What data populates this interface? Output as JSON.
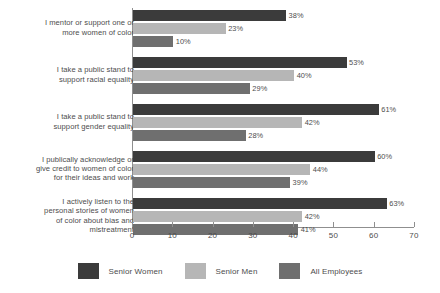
{
  "chart_data": {
    "type": "bar",
    "orientation": "horizontal",
    "title": "",
    "xlabel": "",
    "ylabel": "",
    "xlim": [
      0,
      70
    ],
    "xticks": [
      0,
      10,
      20,
      30,
      40,
      50,
      60,
      70
    ],
    "grid": false,
    "legend_position": "bottom",
    "value_suffix": "%",
    "categories": [
      "I mentor or support one or more women of color",
      "I take a public stand to support racial equality",
      "I take a public stand to support gender equality",
      "I publically acknowledge or give credit to women of color for their ideas and work",
      "I actively listen to the personal stories of women of color about bias and mistreatment"
    ],
    "category_lines": [
      [
        "I mentor or support one or",
        "more women of color"
      ],
      [
        "I take a public stand to",
        "support racial equality"
      ],
      [
        "I take a public stand to",
        "support gender equality"
      ],
      [
        "I publically acknowledge or",
        "give credit to women of color",
        "for their ideas and work"
      ],
      [
        "I actively listen to the",
        "personal stories of women",
        "of color about bias and",
        "mistreatment"
      ]
    ],
    "series": [
      {
        "name": "Senior Women",
        "color": "#3b3b3b",
        "values": [
          38,
          53,
          61,
          60,
          63
        ],
        "labels": [
          "38%",
          "53%",
          "61%",
          "60%",
          "63%"
        ]
      },
      {
        "name": "Senior Men",
        "color": "#b6b6b6",
        "values": [
          23,
          40,
          42,
          44,
          42
        ],
        "labels": [
          "23%",
          "40%",
          "42%",
          "44%",
          "42%"
        ]
      },
      {
        "name": "All Employees",
        "color": "#6f6f6f",
        "values": [
          10,
          29,
          28,
          39,
          41
        ],
        "labels": [
          "10%",
          "29%",
          "28%",
          "39%",
          "41%"
        ]
      }
    ],
    "xtick_labels": [
      "0",
      "10",
      "20",
      "30",
      "40",
      "50",
      "60",
      "70"
    ]
  },
  "legend": {
    "items": [
      {
        "label": "Senior Women",
        "color": "#3b3b3b"
      },
      {
        "label": "Senior Men",
        "color": "#b6b6b6"
      },
      {
        "label": "All Employees",
        "color": "#6f6f6f"
      }
    ]
  },
  "axis": {
    "line_color": "#8f8f8f"
  }
}
